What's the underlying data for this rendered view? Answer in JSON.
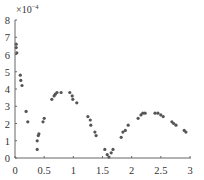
{
  "chart_data": {
    "type": "scatter",
    "title": "",
    "xlabel": "",
    "ylabel": "",
    "y_scale_label": "×10⁻⁴",
    "y_multiplier_text": "×10",
    "y_multiplier_exp": "−4",
    "xlim": [
      0,
      3
    ],
    "ylim": [
      0,
      8
    ],
    "x_ticks": [
      0,
      0.5,
      1,
      1.5,
      2,
      2.5,
      3
    ],
    "x_tick_labels": [
      "0",
      "0.5",
      "1",
      "1.5",
      "2",
      "2.5",
      "3"
    ],
    "y_ticks": [
      0,
      1,
      2,
      3,
      4,
      5,
      6,
      7,
      8
    ],
    "y_tick_labels": [
      "0",
      "1",
      "2",
      "3",
      "4",
      "5",
      "6",
      "7",
      "8"
    ],
    "grid": false,
    "legend": null,
    "marker_color": "#555555",
    "axis_color": "#666666",
    "series": [
      {
        "name": "data",
        "points": [
          [
            0.02,
            6.6
          ],
          [
            0.02,
            6.4
          ],
          [
            0.03,
            6.1
          ],
          [
            0.09,
            4.8
          ],
          [
            0.1,
            4.5
          ],
          [
            0.12,
            4.2
          ],
          [
            0.19,
            2.7
          ],
          [
            0.22,
            2.1
          ],
          [
            0.38,
            0.5
          ],
          [
            0.38,
            1.0
          ],
          [
            0.4,
            1.3
          ],
          [
            0.41,
            1.4
          ],
          [
            0.48,
            2.1
          ],
          [
            0.5,
            2.3
          ],
          [
            0.63,
            3.4
          ],
          [
            0.67,
            3.6
          ],
          [
            0.69,
            3.7
          ],
          [
            0.72,
            3.8
          ],
          [
            0.79,
            3.8
          ],
          [
            0.94,
            3.8
          ],
          [
            0.98,
            3.6
          ],
          [
            0.99,
            3.4
          ],
          [
            1.06,
            3.2
          ],
          [
            1.25,
            2.4
          ],
          [
            1.29,
            2.2
          ],
          [
            1.3,
            1.9
          ],
          [
            1.37,
            1.5
          ],
          [
            1.39,
            1.3
          ],
          [
            1.54,
            0.5
          ],
          [
            1.58,
            0.2
          ],
          [
            1.61,
            0.05
          ],
          [
            1.65,
            0.3
          ],
          [
            1.68,
            0.5
          ],
          [
            1.82,
            1.2
          ],
          [
            1.85,
            1.5
          ],
          [
            1.89,
            1.6
          ],
          [
            1.94,
            1.9
          ],
          [
            2.11,
            2.3
          ],
          [
            2.16,
            2.5
          ],
          [
            2.19,
            2.6
          ],
          [
            2.23,
            2.6
          ],
          [
            2.4,
            2.6
          ],
          [
            2.45,
            2.6
          ],
          [
            2.5,
            2.5
          ],
          [
            2.54,
            2.4
          ],
          [
            2.69,
            2.1
          ],
          [
            2.72,
            2.0
          ],
          [
            2.76,
            1.9
          ],
          [
            2.9,
            1.6
          ],
          [
            2.93,
            1.5
          ]
        ]
      }
    ]
  }
}
